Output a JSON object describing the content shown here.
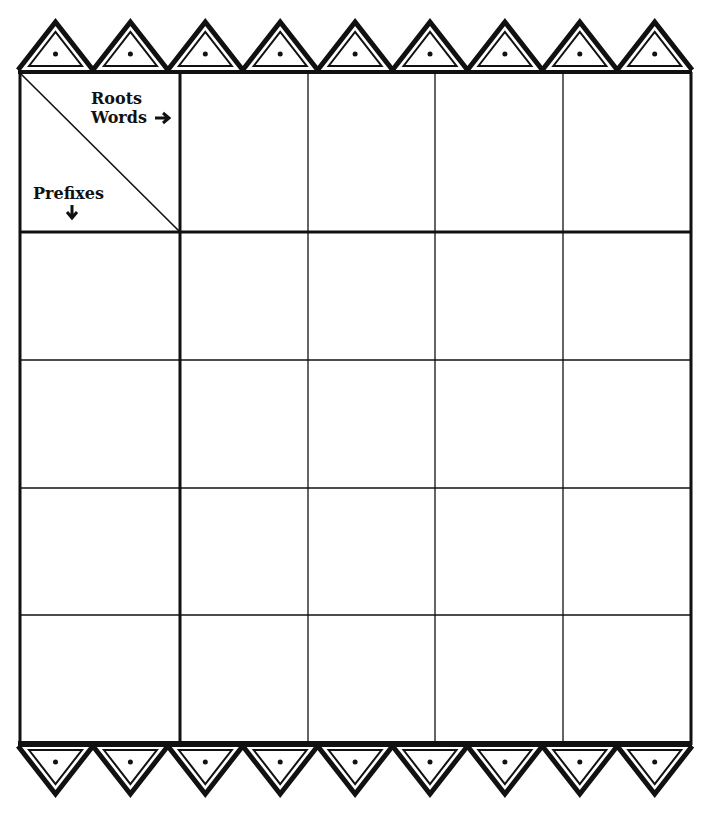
{
  "worksheet": {
    "corner_header": {
      "roots_label": "Roots",
      "words_label": "Words",
      "words_arrow": "➔",
      "prefixes_label": "Prefixes",
      "prefixes_arrow": "🡣"
    },
    "grid": {
      "columns": 5,
      "rows": 5,
      "root_cells": [
        "",
        "",
        "",
        ""
      ],
      "prefix_cells": [
        "",
        "",
        "",
        ""
      ],
      "word_cells": [
        [
          "",
          "",
          "",
          ""
        ],
        [
          "",
          "",
          "",
          ""
        ],
        [
          "",
          "",
          "",
          ""
        ],
        [
          "",
          "",
          "",
          ""
        ]
      ]
    },
    "border_decoration": {
      "top_triangle_count": 9,
      "bottom_triangle_count": 9,
      "style": "double-outline-triangle-with-dot"
    },
    "colors": {
      "ink": "#111111",
      "paper": "#ffffff"
    }
  }
}
